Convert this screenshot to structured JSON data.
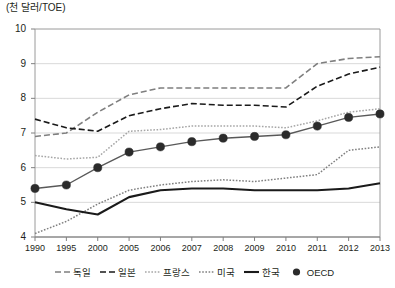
{
  "axis_unit_label": "(천 달러/TOE)",
  "y_ticks": [
    "10",
    "9",
    "8",
    "7",
    "6",
    "5",
    "4"
  ],
  "x_ticks": [
    "1990",
    "1995",
    "2000",
    "2005",
    "2006",
    "2007",
    "2008",
    "2009",
    "2010",
    "2011",
    "2012",
    "2013"
  ],
  "legend": {
    "items": [
      {
        "label": "독일",
        "style": "dashed",
        "color": "#7f7f7f",
        "marker": "none"
      },
      {
        "label": "일본",
        "style": "dashed",
        "color": "#1a1a1a",
        "marker": "none"
      },
      {
        "label": "프랑스",
        "style": "dotted",
        "color": "#a6a6a6",
        "marker": "none"
      },
      {
        "label": "미국",
        "style": "dotted",
        "color": "#808080",
        "marker": "none"
      },
      {
        "label": "한국",
        "style": "solid",
        "color": "#1a1a1a",
        "marker": "none"
      },
      {
        "label": "OECD",
        "style": "solid",
        "color": "#595959",
        "marker": "circle"
      }
    ]
  },
  "chart_data": {
    "type": "line",
    "title": "",
    "xlabel": "",
    "ylabel": "(천 달러/TOE)",
    "ylim": [
      4,
      10
    ],
    "ytick_values": [
      4,
      5,
      6,
      7,
      8,
      9,
      10
    ],
    "grid": true,
    "legend_position": "bottom",
    "categories": [
      "1990",
      "1995",
      "2000",
      "2005",
      "2006",
      "2007",
      "2008",
      "2009",
      "2010",
      "2011",
      "2012",
      "2013"
    ],
    "series": [
      {
        "name": "독일",
        "style": "dashed",
        "color": "#7f7f7f",
        "values": [
          6.9,
          7.0,
          7.6,
          8.1,
          8.3,
          8.3,
          8.3,
          8.3,
          8.3,
          9.0,
          9.15,
          9.2
        ]
      },
      {
        "name": "일본",
        "style": "dashed",
        "color": "#1a1a1a",
        "values": [
          7.4,
          7.15,
          7.05,
          7.5,
          7.7,
          7.85,
          7.8,
          7.8,
          7.75,
          8.35,
          8.7,
          8.9
        ]
      },
      {
        "name": "프랑스",
        "style": "dotted",
        "color": "#a6a6a6",
        "values": [
          6.35,
          6.25,
          6.3,
          7.05,
          7.1,
          7.2,
          7.2,
          7.2,
          7.15,
          7.35,
          7.6,
          7.7
        ]
      },
      {
        "name": "미국",
        "style": "dotted",
        "color": "#808080",
        "values": [
          4.1,
          4.45,
          4.95,
          5.35,
          5.5,
          5.6,
          5.65,
          5.6,
          5.7,
          5.8,
          6.5,
          6.6
        ]
      },
      {
        "name": "한국",
        "style": "solid",
        "color": "#1a1a1a",
        "values": [
          5.0,
          4.8,
          4.65,
          5.15,
          5.35,
          5.4,
          5.4,
          5.35,
          5.35,
          5.35,
          5.4,
          5.55
        ]
      },
      {
        "name": "OECD",
        "style": "solid",
        "color": "#595959",
        "marker": "circle",
        "values": [
          5.4,
          5.5,
          6.0,
          6.45,
          6.6,
          6.75,
          6.85,
          6.9,
          6.95,
          7.2,
          7.45,
          7.55
        ]
      }
    ]
  }
}
